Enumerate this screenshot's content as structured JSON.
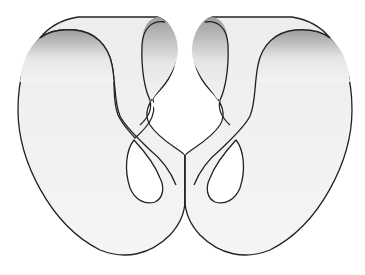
{
  "figure": {
    "title": "Twisted band surface with two figure-eight loops"
  },
  "colors": {
    "background": "#ffffff",
    "outline": "#222222",
    "surface_light": "#f4f4f4",
    "surface_shadow": "#9a9a9a",
    "hole": "#ffffff"
  },
  "lobes": [
    {
      "name": "left-lobe",
      "side": "left"
    },
    {
      "name": "right-lobe",
      "side": "right"
    }
  ]
}
